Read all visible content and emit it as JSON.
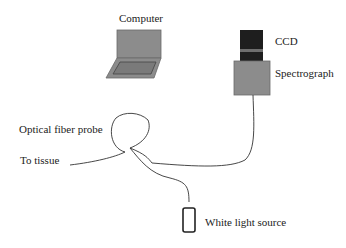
{
  "diagram": {
    "labels": {
      "computer": "Computer",
      "ccd": "CCD",
      "spectrograph": "Spectrograph",
      "optical_fiber_probe": "Optical fiber probe",
      "to_tissue": "To tissue",
      "white_light_source": "White light source"
    },
    "colors": {
      "device_fill": "#8c8c8c",
      "device_stroke": "#555555",
      "ccd_fill": "#1e1e1e",
      "ccd_band": "#6e6e6e",
      "cable": "#333333",
      "text": "#222222",
      "background": "#ffffff"
    },
    "components": [
      "computer",
      "ccd",
      "spectrograph",
      "optical-fiber-probe",
      "white-light-source"
    ]
  }
}
